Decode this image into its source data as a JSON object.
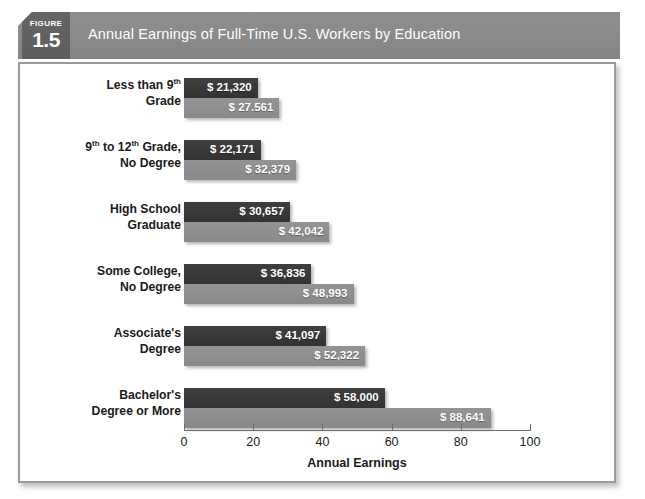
{
  "figure": {
    "label": "FIGURE",
    "number": "1.5",
    "title": "Annual Earnings of Full-Time U.S. Workers by Education"
  },
  "colors": {
    "header_band": "#8a8a8a",
    "figure_badge": "#5e5e5e",
    "bar_dark": "#333333",
    "bar_light": "#8a8a8a",
    "frame_border": "#9a9a9a"
  },
  "chart_data": {
    "type": "bar",
    "orientation": "horizontal",
    "title": "Annual Earnings of Full-Time U.S. Workers by Education",
    "xlabel": "Annual Earnings",
    "ylabel": "",
    "xlim": [
      0,
      100
    ],
    "xticks": [
      0,
      20,
      40,
      60,
      80,
      100
    ],
    "xtick_labels": [
      "0",
      "20",
      "40",
      "60",
      "80",
      "100"
    ],
    "units": "thousands of dollars",
    "grid": false,
    "legend": null,
    "categories": [
      "Less than 9th Grade",
      "9th to 12th Grade, No Degree",
      "High School Graduate",
      "Some College, No Degree",
      "Associate's Degree",
      "Bachelor's Degree or More"
    ],
    "category_lines": [
      [
        "Less than 9",
        "th",
        " Grade"
      ],
      [
        "9",
        "th",
        " to 12",
        "th",
        " Grade, No Degree"
      ],
      [
        "High School Graduate"
      ],
      [
        "Some College, No Degree"
      ],
      [
        "Associate's Degree"
      ],
      [
        "Bachelor's Degree or More"
      ]
    ],
    "series": [
      {
        "name": "dark",
        "values": [
          21.32,
          22.171,
          30.657,
          36.836,
          41.097,
          58.0
        ],
        "labels": [
          "$ 21,320",
          "$ 22,171",
          "$ 30,657",
          "$ 36,836",
          "$ 41,097",
          "$ 58,000"
        ]
      },
      {
        "name": "light",
        "values": [
          27.561,
          32.379,
          42.042,
          48.993,
          52.322,
          88.641
        ],
        "labels": [
          "$ 27.561",
          "$ 32,379",
          "$ 42,042",
          "$ 48,993",
          "$ 52,322",
          "$ 88,641"
        ]
      }
    ]
  },
  "groups": [
    {
      "line1_a": "Less than 9",
      "line1_sup": "th",
      "line1_b": "",
      "line2_a": "Grade",
      "line2_sup": "",
      "line2_b": "",
      "dark_label": "$ 21,320",
      "light_label": "$ 27.561",
      "dark_value": 21.32,
      "light_value": 27.561
    },
    {
      "line1_a": "9",
      "line1_sup": "th",
      "line1_b": " to 12",
      "line1_sup2": "th",
      "line1_c": " Grade,",
      "line2_a": "No Degree",
      "line2_sup": "",
      "line2_b": "",
      "dark_label": "$ 22,171",
      "light_label": "$ 32,379",
      "dark_value": 22.171,
      "light_value": 32.379
    },
    {
      "line1_a": "High School",
      "line1_sup": "",
      "line1_b": "",
      "line2_a": "Graduate",
      "line2_sup": "",
      "line2_b": "",
      "dark_label": "$ 30,657",
      "light_label": "$ 42,042",
      "dark_value": 30.657,
      "light_value": 42.042
    },
    {
      "line1_a": "Some College,",
      "line1_sup": "",
      "line1_b": "",
      "line2_a": "No Degree",
      "line2_sup": "",
      "line2_b": "",
      "dark_label": "$ 36,836",
      "light_label": "$ 48,993",
      "dark_value": 36.836,
      "light_value": 48.993
    },
    {
      "line1_a": "Associate's",
      "line1_sup": "",
      "line1_b": "",
      "line2_a": "Degree",
      "line2_sup": "",
      "line2_b": "",
      "dark_label": "$ 41,097",
      "light_label": "$ 52,322",
      "dark_value": 41.097,
      "light_value": 52.322
    },
    {
      "line1_a": "Bachelor's",
      "line1_sup": "",
      "line1_b": "",
      "line2_a": "Degree or More",
      "line2_sup": "",
      "line2_b": "",
      "dark_label": "$ 58,000",
      "light_label": "$ 88,641",
      "dark_value": 58.0,
      "light_value": 88.641
    }
  ]
}
